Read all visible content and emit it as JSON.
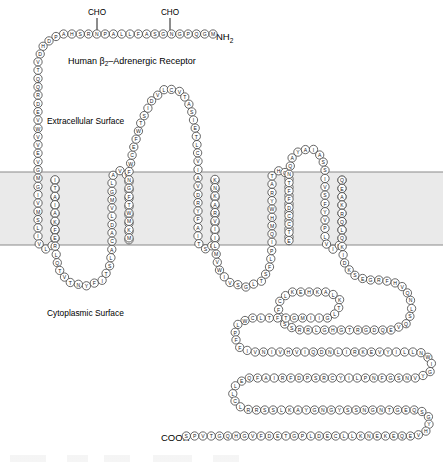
{
  "figure": {
    "title": "Human β2–Adrenergic Receptor",
    "title_main_a": "Human β",
    "title_sub": "2",
    "title_main_b": "–Adrenergic Receptor",
    "extracellular_label": "Extracellular Surface",
    "cytoplasmic_label": "Cytoplasmic Surface",
    "n_terminus_label": "NH",
    "n_terminus_sub": "2",
    "c_terminus_label": "COOH",
    "glycosylation_label_1": "CHO",
    "glycosylation_label_2": "CHO",
    "colors": {
      "membrane_fill": "#eaeaea",
      "membrane_line": "#8a8a8a",
      "residue_fill": "#ffffff",
      "residue_stroke": "#4a4a4a",
      "text": "#000000",
      "background": "#ffffff"
    },
    "membrane": {
      "top_y": 172,
      "bottom_y": 245
    }
  },
  "chart_data": {
    "type": "diagram",
    "title": "Human β2–Adrenergic Receptor",
    "subtype": "snake-plot-membrane-topology",
    "segments": [
      {
        "name": "n-terminus",
        "region": "extracellular",
        "residues": "MGQPGNGSAFLLAPNRSHAPDHDVTQQRDEVWVVE"
      },
      {
        "name": "tm1",
        "region": "membrane",
        "residues": "VGMGIVMSLIVLAIVFGNVLVITAI"
      },
      {
        "name": "icl1",
        "region": "cytoplasmic",
        "residues": "AKFERLQTVTNYFITSL"
      },
      {
        "name": "tm2",
        "region": "membrane",
        "residues": "ACADLVMGLAVVPFGAAHILM"
      },
      {
        "name": "ecl1",
        "region": "extracellular",
        "residues": "KMWTFGNFWCEFWTSIDVLCVTASIETLCVIAVD"
      },
      {
        "name": "tm3",
        "region": "membrane",
        "residues": "RYFAITSPFKYQSLLTKNKARVIILMVWIVSGLTSFLPIQMHWYRAT"
      },
      {
        "name": "ecl2",
        "region": "extracellular",
        "residues": "HQEAINCYANETCCDFFTNQAYAIASSIVSFYVPLVIMVFVYSRVFQ"
      },
      {
        "name": "tm4",
        "region": "membrane",
        "residues": "EAKRQLQKIDKSEGRFHVQNLSQVEQDGRTGHGLRRSS"
      },
      {
        "name": "icl3",
        "region": "cytoplasmic",
        "residues": "KFCLKEHKALKTLGIIMGTFTLCWLPFFIVNIVHVIQDNLIRKEVYILLNWIGYVNSGFNPLIYCRSPDFRIAFQELLCLRRSSLKAYGNGYSSNGNTGEQSGYHVEQEKENKLLCEDLPGTEDFVGHQGTVPSDNIDSQGRNCSTNDSLL"
      },
      {
        "name": "c-terminus",
        "region": "cytoplasmic",
        "residues": "LLSDHTSCHRGQSDIKQSPVT"
      }
    ],
    "glycosylation_sites": [
      {
        "label": "CHO",
        "x": 97,
        "y": 13
      },
      {
        "label": "CHO",
        "x": 170,
        "y": 13
      }
    ],
    "labels": [
      {
        "text": "NH2",
        "role": "n-terminus",
        "x": 218,
        "y": 37
      },
      {
        "text": "COOH",
        "role": "c-terminus",
        "x": 163,
        "y": 437
      },
      {
        "text": "Extracellular Surface",
        "role": "surface",
        "x": 47,
        "y": 121
      },
      {
        "text": "Cytoplasmic Surface",
        "role": "surface",
        "x": 47,
        "y": 313
      },
      {
        "text": "Human β2–Adrenergic Receptor",
        "role": "title",
        "x": 68,
        "y": 62
      }
    ]
  }
}
